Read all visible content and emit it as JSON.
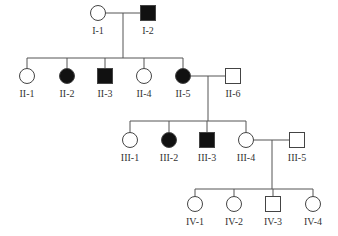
{
  "diagram": {
    "type": "pedigree",
    "colors": {
      "affected": "#111111",
      "unaffected": "#ffffff",
      "line": "#555555"
    },
    "individuals": [
      {
        "id": "I-1",
        "label": "I-1",
        "sex": "female",
        "affected": false,
        "x": 98,
        "y": 13
      },
      {
        "id": "I-2",
        "label": "I-2",
        "sex": "male",
        "affected": true,
        "x": 148,
        "y": 13
      },
      {
        "id": "II-1",
        "label": "II-1",
        "sex": "female",
        "affected": false,
        "x": 27,
        "y": 76
      },
      {
        "id": "II-2",
        "label": "II-2",
        "sex": "female",
        "affected": true,
        "x": 67,
        "y": 76
      },
      {
        "id": "II-3",
        "label": "II-3",
        "sex": "male",
        "affected": true,
        "x": 105,
        "y": 76
      },
      {
        "id": "II-4",
        "label": "II-4",
        "sex": "female",
        "affected": false,
        "x": 144,
        "y": 76
      },
      {
        "id": "II-5",
        "label": "II-5",
        "sex": "female",
        "affected": true,
        "x": 183,
        "y": 76
      },
      {
        "id": "II-6",
        "label": "II-6",
        "sex": "male",
        "affected": false,
        "x": 233,
        "y": 76
      },
      {
        "id": "III-1",
        "label": "III-1",
        "sex": "female",
        "affected": false,
        "x": 130,
        "y": 140
      },
      {
        "id": "III-2",
        "label": "III-2",
        "sex": "female",
        "affected": true,
        "x": 169,
        "y": 140
      },
      {
        "id": "III-3",
        "label": "III-3",
        "sex": "male",
        "affected": true,
        "x": 207,
        "y": 140
      },
      {
        "id": "III-4",
        "label": "III-4",
        "sex": "female",
        "affected": false,
        "x": 246,
        "y": 140
      },
      {
        "id": "III-5",
        "label": "III-5",
        "sex": "male",
        "affected": false,
        "x": 297,
        "y": 140
      },
      {
        "id": "IV-1",
        "label": "IV-1",
        "sex": "female",
        "affected": false,
        "x": 195,
        "y": 204
      },
      {
        "id": "IV-2",
        "label": "IV-2",
        "sex": "female",
        "affected": false,
        "x": 234,
        "y": 204
      },
      {
        "id": "IV-3",
        "label": "IV-3",
        "sex": "male",
        "affected": false,
        "x": 273,
        "y": 204
      },
      {
        "id": "IV-4",
        "label": "IV-4",
        "sex": "female",
        "affected": false,
        "x": 313,
        "y": 204
      }
    ],
    "matings": [
      {
        "partners": [
          "I-1",
          "I-2"
        ],
        "drop_x": 123,
        "y": 13,
        "sib_y": 58,
        "children": [
          "II-1",
          "II-2",
          "II-3",
          "II-4",
          "II-5"
        ]
      },
      {
        "partners": [
          "II-5",
          "II-6"
        ],
        "drop_x": 208,
        "y": 76,
        "sib_y": 121,
        "children": [
          "III-1",
          "III-2",
          "III-3",
          "III-4"
        ]
      },
      {
        "partners": [
          "III-4",
          "III-5"
        ],
        "drop_x": 272,
        "y": 140,
        "sib_y": 189,
        "children": [
          "IV-1",
          "IV-2",
          "IV-3",
          "IV-4"
        ]
      }
    ]
  }
}
